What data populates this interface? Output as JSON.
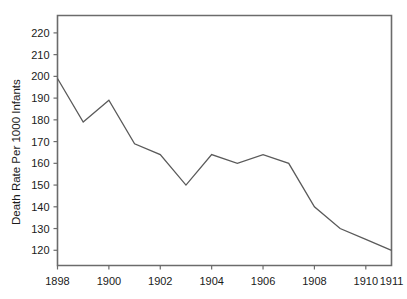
{
  "chart_data": {
    "type": "line",
    "title": "",
    "subtitle": "",
    "xlabel": "",
    "ylabel": "Death Rate Per 1000 Infants",
    "x": [
      1898,
      1899,
      1900,
      1901,
      1902,
      1903,
      1904,
      1905,
      1906,
      1907,
      1908,
      1909,
      1910,
      1911
    ],
    "values": [
      199,
      179,
      189,
      169,
      164,
      150,
      164,
      160,
      164,
      160,
      140,
      130,
      125,
      120
    ],
    "series": [
      {
        "name": "Infant death rate",
        "values": [
          199,
          179,
          189,
          169,
          164,
          150,
          164,
          160,
          164,
          160,
          140,
          130,
          125,
          120
        ]
      }
    ],
    "xlim": [
      1898,
      1911
    ],
    "ylim": [
      113,
      228
    ],
    "ytick_labels": [
      "120",
      "130",
      "140",
      "150",
      "160",
      "170",
      "180",
      "190",
      "200",
      "210",
      "220"
    ],
    "ytick_values": [
      120,
      130,
      140,
      150,
      160,
      170,
      180,
      190,
      200,
      210,
      220
    ],
    "xtick_labels": [
      "1898",
      "1900",
      "1902",
      "1904",
      "1906",
      "1908",
      "1910",
      "1911"
    ],
    "xtick_values": [
      1898,
      1900,
      1902,
      1904,
      1906,
      1908,
      1910,
      1911
    ],
    "grid": false,
    "legend": "none",
    "line_color": "#5a5a5a",
    "axis_color": "#6b6b6b",
    "text_color": "#1a1a1a",
    "background": "#ffffff"
  }
}
